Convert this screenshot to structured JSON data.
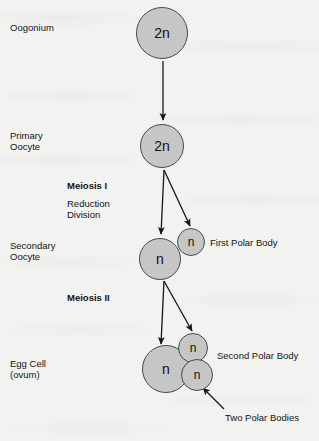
{
  "diagram": {
    "type": "biology-flow-diagram",
    "background_color": "#f2f2f0",
    "cell_fill_color": "#c6c6c6",
    "cell_stroke_color": "#4a4a4a",
    "text_color": "#141414"
  },
  "stage_labels": {
    "oogonium": "Oogonium",
    "primary_oocyte_line1": "Primary",
    "primary_oocyte_line2": "Oocyte",
    "secondary_oocyte_line1": "Secondary",
    "secondary_oocyte_line2": "Oocyte",
    "egg_cell_line1": "Egg Cell",
    "egg_cell_line2": "(ovum)"
  },
  "process_labels": {
    "meiosis_one": "Meiosis I",
    "reduction_line1": "Reduction",
    "reduction_line2": "Division",
    "meiosis_two": "Meiosis II"
  },
  "product_labels": {
    "first_polar_body": "First Polar Body",
    "second_polar_body": "Second Polar Body",
    "two_polar_bodies": "Two Polar Bodies"
  },
  "cells": [
    {
      "id": "oogonium",
      "ploidy": "2n",
      "cx": 162,
      "cy": 33,
      "r": 26
    },
    {
      "id": "primary-oocyte",
      "ploidy": "2n",
      "cx": 162,
      "cy": 146,
      "r": 22
    },
    {
      "id": "secondary-oocyte",
      "ploidy": "n",
      "cx": 160,
      "cy": 259,
      "r": 21
    },
    {
      "id": "first-polar-body",
      "ploidy": "n",
      "cx": 191,
      "cy": 242,
      "r": 14
    },
    {
      "id": "egg-cell",
      "ploidy": "n",
      "cx": 166,
      "cy": 369,
      "r": 24
    },
    {
      "id": "upper-polar-body",
      "ploidy": "n",
      "cx": 193,
      "cy": 348,
      "r": 15
    },
    {
      "id": "lower-polar-body",
      "ploidy": "n",
      "cx": 197,
      "cy": 375,
      "r": 16
    }
  ]
}
